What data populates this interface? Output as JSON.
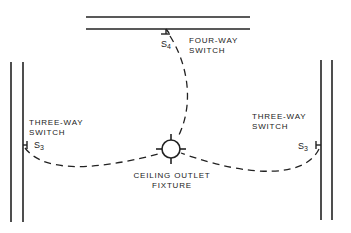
{
  "diagram": {
    "type": "wiring-plan",
    "colors": {
      "line": "#222222",
      "background": "#ffffff"
    },
    "fixture": {
      "label_line1": "CEILING OUTLET",
      "label_line2": "FIXTURE",
      "icon": "ceiling-outlet-icon"
    },
    "switches": [
      {
        "id": "four-way",
        "label_line1": "FOUR-WAY",
        "label_line2": "SWITCH",
        "symbol": "S",
        "subscript": "4"
      },
      {
        "id": "three-way-left",
        "label_line1": "THREE-WAY",
        "label_line2": "SWITCH",
        "symbol": "S",
        "subscript": "3"
      },
      {
        "id": "three-way-right",
        "label_line1": "THREE-WAY",
        "label_line2": "SWITCH",
        "symbol": "S",
        "subscript": "3"
      }
    ]
  }
}
